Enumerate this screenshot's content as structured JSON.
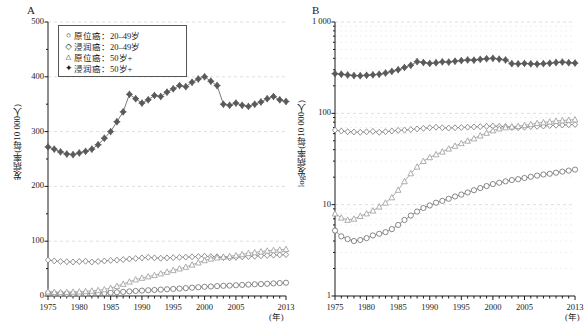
{
  "figure": {
    "panels": [
      {
        "id": "A",
        "letter": "A",
        "ylabel": "发病率(每10 000人)",
        "xlabel_unit": "(年)",
        "yticks": [
          "0",
          "100",
          "200",
          "300",
          "400",
          "500"
        ],
        "xticks": [
          "1975",
          "1980",
          "1985",
          "1990",
          "1995",
          "2000",
          "2005",
          "2013"
        ]
      },
      {
        "id": "B",
        "letter": "B",
        "ylabel": "log发病率(每10 000人)",
        "xlabel_unit": "(年)",
        "yticks": [
          "1",
          "10",
          "100",
          "1 000"
        ],
        "xticks": [
          "1975",
          "1980",
          "1985",
          "1990",
          "1995",
          "2000",
          "2005",
          "2013"
        ]
      }
    ],
    "legend": {
      "position": "top-left-panel-A",
      "items": [
        {
          "symbol": "circle",
          "label": "原位癌：20–49岁"
        },
        {
          "symbol": "diamond",
          "label": "浸润癌：20–49岁"
        },
        {
          "symbol": "triangle",
          "label": "原位癌：50岁+"
        },
        {
          "symbol": "diamond-filled",
          "label": "浸润癌：50岁+"
        }
      ]
    }
  },
  "chart_data": [
    {
      "type": "line",
      "panel": "A",
      "title": "",
      "xlabel": "(年)",
      "ylabel": "发病率(每10 000人)",
      "xlim": [
        1975,
        2013
      ],
      "ylim": [
        0,
        500
      ],
      "grid": true,
      "scale": "linear",
      "legend_position": "upper-left",
      "x": [
        1975,
        1976,
        1977,
        1978,
        1979,
        1980,
        1981,
        1982,
        1983,
        1984,
        1985,
        1986,
        1987,
        1988,
        1989,
        1990,
        1991,
        1992,
        1993,
        1994,
        1995,
        1996,
        1997,
        1998,
        1999,
        2000,
        2001,
        2002,
        2003,
        2004,
        2005,
        2006,
        2007,
        2008,
        2009,
        2010,
        2011,
        2012,
        2013
      ],
      "series": [
        {
          "name": "原位癌：20–49岁",
          "symbol": "circle",
          "color": "#6b6b6b",
          "values": [
            5.2,
            4.5,
            4.2,
            4.0,
            4.1,
            4.3,
            4.6,
            4.8,
            5.0,
            5.4,
            6.0,
            6.8,
            7.6,
            8.4,
            9.2,
            9.8,
            10.5,
            11.0,
            11.6,
            12.3,
            12.9,
            13.6,
            14.4,
            15.2,
            16.0,
            16.8,
            17.4,
            18.0,
            18.6,
            19.0,
            19.6,
            20.2,
            20.8,
            21.4,
            21.8,
            22.4,
            23.0,
            23.6,
            24.2
          ]
        },
        {
          "name": "浸润癌：20–49岁",
          "symbol": "diamond",
          "color": "#7a7a7a",
          "values": [
            65.5,
            64.0,
            63.0,
            62.5,
            62.0,
            62.8,
            63.5,
            62.0,
            63.0,
            64.0,
            65.0,
            65.5,
            66.5,
            67.5,
            68.5,
            69.5,
            70.5,
            69.5,
            69.0,
            69.5,
            70.0,
            70.5,
            71.0,
            71.5,
            72.0,
            72.5,
            72.0,
            71.5,
            70.0,
            69.5,
            70.5,
            71.5,
            72.0,
            72.5,
            73.5,
            74.0,
            74.5,
            75.0,
            75.5
          ]
        },
        {
          "name": "原位癌：50岁+",
          "symbol": "triangle",
          "color": "#9a9a9a",
          "values": [
            8.0,
            7.2,
            6.8,
            7.0,
            7.5,
            8.0,
            8.6,
            9.5,
            10.5,
            12.0,
            14.5,
            18.0,
            22.0,
            26.0,
            30.0,
            33.0,
            35.5,
            38.0,
            41.0,
            44.0,
            47.0,
            50.0,
            53.0,
            57.0,
            61.0,
            65.0,
            68.0,
            70.0,
            71.5,
            72.5,
            74.0,
            76.0,
            78.0,
            79.5,
            81.0,
            82.5,
            83.5,
            84.5,
            85.5
          ]
        },
        {
          "name": "浸润癌：50岁+",
          "symbol": "diamond-filled",
          "color": "#5a5a5a",
          "values": [
            272,
            268,
            263,
            259,
            258,
            261,
            264,
            268,
            276,
            288,
            300,
            318,
            336,
            368,
            360,
            352,
            358,
            366,
            364,
            372,
            378,
            384,
            382,
            390,
            396,
            400,
            392,
            384,
            350,
            348,
            352,
            348,
            346,
            350,
            354,
            360,
            364,
            358,
            355
          ]
        }
      ]
    },
    {
      "type": "line",
      "panel": "B",
      "title": "",
      "xlabel": "(年)",
      "ylabel": "log发病率(每10 000人)",
      "xlim": [
        1975,
        2013
      ],
      "ylim": [
        1,
        1000
      ],
      "grid": true,
      "scale": "log",
      "legend_position": "none",
      "x": [
        1975,
        1976,
        1977,
        1978,
        1979,
        1980,
        1981,
        1982,
        1983,
        1984,
        1985,
        1986,
        1987,
        1988,
        1989,
        1990,
        1991,
        1992,
        1993,
        1994,
        1995,
        1996,
        1997,
        1998,
        1999,
        2000,
        2001,
        2002,
        2003,
        2004,
        2005,
        2006,
        2007,
        2008,
        2009,
        2010,
        2011,
        2012,
        2013
      ],
      "series": [
        {
          "name": "原位癌：20–49岁",
          "symbol": "circle",
          "color": "#6b6b6b",
          "values": [
            5.2,
            4.5,
            4.2,
            4.0,
            4.1,
            4.3,
            4.6,
            4.8,
            5.0,
            5.4,
            6.0,
            6.8,
            7.6,
            8.4,
            9.2,
            9.8,
            10.5,
            11.0,
            11.6,
            12.3,
            12.9,
            13.6,
            14.4,
            15.2,
            16.0,
            16.8,
            17.4,
            18.0,
            18.6,
            19.0,
            19.6,
            20.2,
            20.8,
            21.4,
            21.8,
            22.4,
            23.0,
            23.6,
            24.2
          ]
        },
        {
          "name": "浸润癌：20–49岁",
          "symbol": "diamond",
          "color": "#7a7a7a",
          "values": [
            65.5,
            64.0,
            63.0,
            62.5,
            62.0,
            62.8,
            63.5,
            62.0,
            63.0,
            64.0,
            65.0,
            65.5,
            66.5,
            67.5,
            68.5,
            69.5,
            70.5,
            69.5,
            69.0,
            69.5,
            70.0,
            70.5,
            71.0,
            71.5,
            72.0,
            72.5,
            72.0,
            71.5,
            70.0,
            69.5,
            70.5,
            71.5,
            72.0,
            72.5,
            73.5,
            74.0,
            74.5,
            75.0,
            75.5
          ]
        },
        {
          "name": "原位癌：50岁+",
          "symbol": "triangle",
          "color": "#9a9a9a",
          "values": [
            8.0,
            7.2,
            6.8,
            7.0,
            7.5,
            8.0,
            8.6,
            9.5,
            10.5,
            12.0,
            14.5,
            18.0,
            22.0,
            26.0,
            30.0,
            33.0,
            35.5,
            38.0,
            41.0,
            44.0,
            47.0,
            50.0,
            53.0,
            57.0,
            61.0,
            65.0,
            68.0,
            70.0,
            71.5,
            72.5,
            74.0,
            76.0,
            78.0,
            79.5,
            81.0,
            82.5,
            83.5,
            84.5,
            85.5
          ]
        },
        {
          "name": "浸润癌：50岁+",
          "symbol": "diamond-filled",
          "color": "#5a5a5a",
          "values": [
            272,
            268,
            263,
            259,
            258,
            261,
            264,
            268,
            276,
            288,
            300,
            318,
            336,
            368,
            360,
            352,
            358,
            366,
            364,
            372,
            378,
            384,
            382,
            390,
            396,
            400,
            392,
            384,
            350,
            348,
            352,
            348,
            346,
            350,
            354,
            360,
            364,
            358,
            355
          ]
        }
      ]
    }
  ]
}
